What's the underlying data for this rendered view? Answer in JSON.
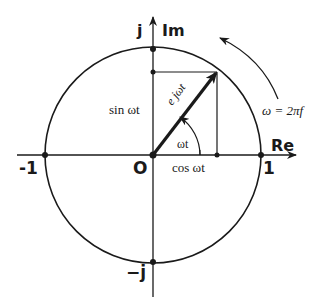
{
  "diagram": {
    "labels": {
      "imag_unit": "j",
      "imag_axis": "Im",
      "real_axis": "Re",
      "neg_one": "-1",
      "one": "1",
      "origin": "O",
      "neg_j": "−j",
      "sine": "sin ωt",
      "cosine": "cos ωt",
      "angle": "ωt",
      "phasor": "e jωt",
      "omega_eq": "ω = 2πf"
    },
    "geometry": {
      "origin": [
        153,
        155
      ],
      "radius": 108,
      "phasor_tip": [
        217,
        72
      ]
    },
    "colors": {
      "ink": "#1a1a1a",
      "background": "#ffffff"
    }
  }
}
